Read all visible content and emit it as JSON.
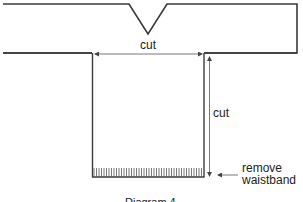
{
  "diagram": {
    "caption": "Diagram 4",
    "labels": {
      "horizontal_cut": "cut",
      "vertical_cut": "cut",
      "remove_line1": "remove",
      "remove_line2": "waistband"
    },
    "colors": {
      "outline": "#3a3a3a",
      "arrow": "#555555",
      "text": "#222222",
      "background": "#ffffff"
    }
  }
}
